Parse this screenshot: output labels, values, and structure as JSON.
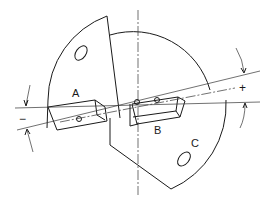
{
  "diagram": {
    "type": "technical-drawing",
    "labels": {
      "a": "A",
      "b": "B",
      "c": "C"
    },
    "signs": {
      "minus": "−",
      "plus": "+"
    },
    "colors": {
      "line": "#1a1a1a",
      "background": "#ffffff"
    }
  }
}
